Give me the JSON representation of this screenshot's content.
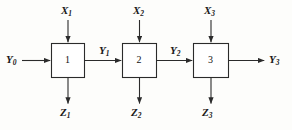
{
  "diagram": {
    "stroke_color": "#2b2b2b",
    "box_fill": "#ffffff",
    "background": "#fdfdfb",
    "blocks": [
      {
        "id": "block-1",
        "number": "1",
        "x": 51,
        "y": 43,
        "w": 33,
        "h": 34
      },
      {
        "id": "block-2",
        "number": "2",
        "x": 122,
        "y": 43,
        "w": 34,
        "h": 34
      },
      {
        "id": "block-3",
        "number": "3",
        "x": 193,
        "y": 43,
        "w": 35,
        "h": 34
      }
    ],
    "labels": {
      "input_top": [
        {
          "name": "X",
          "sub": "1",
          "x": 61,
          "y": 5
        },
        {
          "name": "X",
          "sub": "2",
          "x": 133,
          "y": 5
        },
        {
          "name": "X",
          "sub": "3",
          "x": 204,
          "y": 5
        }
      ],
      "signals_horizontal": [
        {
          "name": "Y",
          "sub": "0",
          "x": 6,
          "y": 54
        },
        {
          "name": "Y",
          "sub": "1",
          "x": 99,
          "y": 45
        },
        {
          "name": "Y",
          "sub": "2",
          "x": 170,
          "y": 45
        },
        {
          "name": "Y",
          "sub": "3",
          "x": 269,
          "y": 54
        }
      ],
      "output_bottom": [
        {
          "name": "Z",
          "sub": "1",
          "x": 60,
          "y": 107
        },
        {
          "name": "Z",
          "sub": "2",
          "x": 131,
          "y": 107
        },
        {
          "name": "Z",
          "sub": "3",
          "x": 202,
          "y": 107
        }
      ]
    }
  }
}
